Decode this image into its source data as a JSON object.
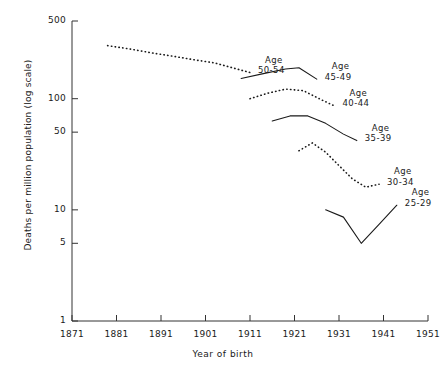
{
  "chart_data": {
    "type": "line",
    "title": "",
    "xlabel": "Year of birth",
    "ylabel": "Deaths per million population (log scale)",
    "yscale": "log",
    "ylim": [
      1,
      500
    ],
    "xlim": [
      1871,
      1951
    ],
    "grid": false,
    "legend_position": "inline-right-of-each-curve",
    "y_ticks": [
      {
        "value": 1,
        "label": "1"
      },
      {
        "value": 5,
        "label": "5"
      },
      {
        "value": 10,
        "label": "10"
      },
      {
        "value": 50,
        "label": "50"
      },
      {
        "value": 100,
        "label": "100"
      },
      {
        "value": 500,
        "label": "500"
      }
    ],
    "x_ticks": [
      {
        "value": 1871,
        "label": "1871"
      },
      {
        "value": 1881,
        "label": "1881"
      },
      {
        "value": 1891,
        "label": "1891"
      },
      {
        "value": 1901,
        "label": "1901"
      },
      {
        "value": 1911,
        "label": "1911"
      },
      {
        "value": 1921,
        "label": "1921"
      },
      {
        "value": 1931,
        "label": "1931"
      },
      {
        "value": 1941,
        "label": "1941"
      },
      {
        "value": 1951,
        "label": "1951"
      }
    ],
    "series": [
      {
        "name": "Age 50-54",
        "label_line1": "Age",
        "label_line2": "50-54",
        "style": "dotted",
        "color": "#1a1a1a",
        "x": [
          1879,
          1884,
          1889,
          1894,
          1899,
          1903,
          1907,
          1911
        ],
        "values": [
          300,
          280,
          258,
          240,
          222,
          210,
          190,
          172
        ]
      },
      {
        "name": "Age 45-49",
        "label_line1": "Age",
        "label_line2": "45-49",
        "style": "solid",
        "color": "#1a1a1a",
        "x": [
          1909,
          1914,
          1919,
          1922,
          1926
        ],
        "values": [
          152,
          168,
          185,
          190,
          150
        ]
      },
      {
        "name": "Age 40-44",
        "label_line1": "Age",
        "label_line2": "40-44",
        "style": "dotted",
        "color": "#1a1a1a",
        "x": [
          1911,
          1915,
          1919,
          1923,
          1927,
          1930
        ],
        "values": [
          100,
          112,
          122,
          118,
          98,
          86
        ]
      },
      {
        "name": "Age 35-39",
        "label_line1": "Age",
        "label_line2": "35-39",
        "style": "solid",
        "color": "#1a1a1a",
        "x": [
          1916,
          1920,
          1924,
          1928,
          1932,
          1935
        ],
        "values": [
          63,
          70,
          70,
          60,
          48,
          42
        ]
      },
      {
        "name": "Age 30-34",
        "label_line1": "Age",
        "label_line2": "30-34",
        "style": "dotted",
        "color": "#1a1a1a",
        "x": [
          1922,
          1925,
          1928,
          1931,
          1934,
          1937,
          1940
        ],
        "values": [
          34,
          40,
          33,
          25,
          19,
          16,
          17
        ]
      },
      {
        "name": "Age 25-29",
        "label_line1": "Age",
        "label_line2": "25-29",
        "style": "solid",
        "color": "#1a1a1a",
        "x": [
          1928,
          1932,
          1936,
          1940,
          1944
        ],
        "values": [
          10,
          8.6,
          5.0,
          7.4,
          11.0
        ]
      }
    ]
  },
  "axes": {
    "y_title": "Deaths per million population (log scale)",
    "x_title": "Year of birth"
  }
}
